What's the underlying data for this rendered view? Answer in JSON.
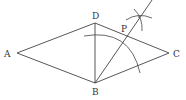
{
  "diagram": {
    "type": "geometry-construction",
    "stroke_color": "#444444",
    "points": {
      "A": {
        "label": "A",
        "x": 17,
        "y": 53
      },
      "B": {
        "label": "B",
        "x": 95,
        "y": 83
      },
      "C": {
        "label": "C",
        "x": 169,
        "y": 53
      },
      "D": {
        "label": "D",
        "x": 95,
        "y": 23
      },
      "P": {
        "label": "P",
        "x": 122,
        "y": 35
      }
    },
    "segments": [
      "AD",
      "DC",
      "CB",
      "BA",
      "DB",
      "BP-ray"
    ],
    "labels": {
      "A": "A",
      "B": "B",
      "C": "C",
      "D": "D",
      "P": "P"
    }
  }
}
